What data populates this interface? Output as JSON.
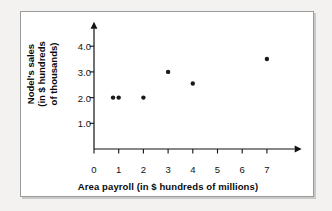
{
  "figure": {
    "background_color": "#ffffff",
    "page_background_color": "#f3f2f0",
    "border_color": "#9b9b9b"
  },
  "chart_data": {
    "type": "scatter",
    "title": "",
    "xlabel": "Area payroll (in $ hundreds of millions)",
    "ylabel_lines": [
      "Nodel's sales",
      "(in $ hundreds",
      "of thousands)"
    ],
    "ylabel": "Nodel's sales (in $ hundreds of thousands)",
    "x": [
      1,
      1,
      2,
      3,
      4,
      7
    ],
    "y": [
      2.0,
      2.0,
      2.0,
      3.0,
      2.6,
      3.5
    ],
    "points": [
      {
        "x": 0.77,
        "y": 2.0
      },
      {
        "x": 1.0,
        "y": 2.0
      },
      {
        "x": 2.0,
        "y": 2.0
      },
      {
        "x": 3.0,
        "y": 3.0
      },
      {
        "x": 4.0,
        "y": 2.55
      },
      {
        "x": 7.0,
        "y": 3.5
      }
    ],
    "marker_color": "#1a1a1a",
    "marker_size_px": 3.4,
    "xlim": [
      0,
      7.8
    ],
    "ylim": [
      0,
      4.6
    ],
    "xticks": [
      0,
      1,
      2,
      3,
      4,
      5,
      6,
      7
    ],
    "xtick_labels": [
      "0",
      "1",
      "2",
      "3",
      "4",
      "5",
      "6",
      "7"
    ],
    "yticks": [
      1.0,
      2.0,
      3.0,
      4.0
    ],
    "ytick_labels": [
      "1.0",
      "2.0",
      "3.0",
      "4.0"
    ],
    "grid": false,
    "legend": false,
    "axis_arrows": {
      "x": "right",
      "y": "up"
    },
    "axis_color": "#111111"
  }
}
